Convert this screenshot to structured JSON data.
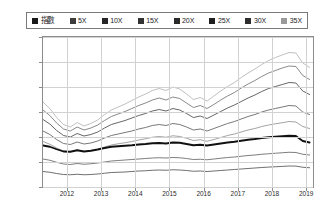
{
  "legend": {
    "position": "top",
    "items": [
      {
        "label": "指數",
        "color": "#1a1a1a",
        "cjk": true
      },
      {
        "label": "5X",
        "color": "#3d3d3d",
        "cjk": false
      },
      {
        "label": "10X",
        "color": "#262626",
        "cjk": false
      },
      {
        "label": "15X",
        "color": "#333333",
        "cjk": false
      },
      {
        "label": "20X",
        "color": "#2b2b2b",
        "cjk": false
      },
      {
        "label": "25X",
        "color": "#1f1f1f",
        "cjk": false
      },
      {
        "label": "30X",
        "color": "#2e2e2e",
        "cjk": false
      },
      {
        "label": "35X",
        "color": "#9a9a9a",
        "cjk": false
      }
    ]
  },
  "axes": {
    "y_ticks": [
      "0",
      "5,000",
      "10,000",
      "15,000",
      "20,000",
      "25,000",
      "30,000"
    ],
    "x_ticks": [
      "2012",
      "2013",
      "2014",
      "2015",
      "2016",
      "2017",
      "2018",
      "2019"
    ]
  },
  "chart_data": {
    "type": "line",
    "title": "",
    "xlabel": "",
    "ylabel": "",
    "ylim": [
      0,
      30000
    ],
    "xlim": [
      2011.3,
      2019.2
    ],
    "grid": true,
    "legend_position": "top",
    "x": [
      2011.3,
      2011.5,
      2011.7,
      2011.9,
      2012.1,
      2012.3,
      2012.5,
      2012.7,
      2012.9,
      2013.1,
      2013.3,
      2013.5,
      2013.7,
      2013.9,
      2014.1,
      2014.3,
      2014.5,
      2014.7,
      2014.9,
      2015.1,
      2015.3,
      2015.5,
      2015.7,
      2015.9,
      2016.1,
      2016.3,
      2016.5,
      2016.7,
      2016.9,
      2017.1,
      2017.3,
      2017.5,
      2017.7,
      2017.9,
      2018.1,
      2018.3,
      2018.5,
      2018.7,
      2018.9,
      2019.1
    ],
    "series": [
      {
        "name": "指數",
        "color": "#111111",
        "width": 1.8,
        "values": [
          8300,
          8050,
          7550,
          7100,
          7050,
          7350,
          7100,
          7250,
          7500,
          7800,
          8050,
          8150,
          8250,
          8350,
          8500,
          8600,
          8750,
          8800,
          8700,
          8900,
          8850,
          8600,
          8350,
          8450,
          8300,
          8500,
          8700,
          8900,
          9050,
          9250,
          9450,
          9600,
          9800,
          9950,
          10050,
          10150,
          10250,
          10200,
          9200,
          8900
        ]
      },
      {
        "name": "5X",
        "color": "#5c5c5c",
        "width": 0.8,
        "values": [
          5600,
          5350,
          4950,
          4600,
          4500,
          4700,
          4550,
          4650,
          4800,
          5000,
          5200,
          5300,
          5400,
          5500,
          5600,
          5700,
          5800,
          5850,
          5800,
          5900,
          5850,
          5700,
          5500,
          5550,
          5450,
          5600,
          5750,
          5900,
          6000,
          6150,
          6300,
          6400,
          6550,
          6650,
          6750,
          6850,
          6950,
          6900,
          6550,
          6400
        ]
      },
      {
        "name": "10X",
        "color": "#4a4a4a",
        "width": 0.8,
        "values": [
          3100,
          2950,
          2700,
          2500,
          2450,
          2550,
          2450,
          2500,
          2600,
          2750,
          2900,
          2950,
          3000,
          3100,
          3200,
          3250,
          3350,
          3400,
          3350,
          3450,
          3400,
          3300,
          3150,
          3200,
          3100,
          3200,
          3300,
          3400,
          3500,
          3600,
          3700,
          3800,
          3900,
          3980,
          4050,
          4120,
          4200,
          4180,
          3950,
          3850
        ]
      },
      {
        "name": "15X",
        "color": "#555555",
        "width": 0.8,
        "values": [
          11200,
          10500,
          9500,
          8700,
          8500,
          9000,
          8600,
          8800,
          9200,
          9800,
          10300,
          10600,
          10900,
          11200,
          11600,
          11900,
          12300,
          12500,
          12300,
          12700,
          12500,
          12000,
          11400,
          11600,
          11200,
          11700,
          12200,
          12700,
          13100,
          13600,
          14100,
          14500,
          15000,
          15400,
          15700,
          16000,
          16300,
          16200,
          15000,
          14500
        ]
      },
      {
        "name": "20X",
        "color": "#3f3f3f",
        "width": 0.8,
        "values": [
          13500,
          12600,
          11300,
          10300,
          10000,
          10700,
          10200,
          10500,
          11000,
          11800,
          12500,
          12900,
          13300,
          13800,
          14300,
          14700,
          15200,
          15500,
          15200,
          15700,
          15400,
          14700,
          13900,
          14200,
          13700,
          14400,
          15100,
          15800,
          16400,
          17100,
          17800,
          18400,
          19100,
          19700,
          20100,
          20500,
          20900,
          20800,
          19200,
          18500
        ]
      },
      {
        "name": "25X",
        "color": "#6b6b6b",
        "width": 0.8,
        "values": [
          15400,
          14300,
          12800,
          11600,
          11200,
          12000,
          11400,
          11800,
          12400,
          13300,
          14100,
          14600,
          15100,
          15700,
          16300,
          16800,
          17400,
          17800,
          17400,
          18000,
          17700,
          16800,
          15900,
          16300,
          15700,
          16500,
          17400,
          18200,
          18900,
          19800,
          20600,
          21300,
          22100,
          22800,
          23300,
          23800,
          24200,
          24100,
          22300,
          21500
        ]
      },
      {
        "name": "30X",
        "color": "#8a8a8a",
        "width": 0.8,
        "values": [
          9100,
          8550,
          7800,
          7200,
          7050,
          7400,
          7100,
          7250,
          7550,
          8000,
          8400,
          8650,
          8850,
          9100,
          9400,
          9650,
          9950,
          10100,
          9950,
          10250,
          10100,
          9750,
          9300,
          9450,
          9150,
          9500,
          9900,
          10300,
          10600,
          11000,
          11400,
          11700,
          12100,
          12400,
          12650,
          12850,
          13100,
          13000,
          12100,
          11700
        ]
      },
      {
        "name": "35X",
        "color": "#b8b8b8",
        "width": 0.9,
        "values": [
          17000,
          15700,
          13900,
          12500,
          12000,
          12900,
          12200,
          12700,
          13400,
          14500,
          15400,
          16000,
          16600,
          17300,
          18000,
          18600,
          19300,
          19700,
          19300,
          20000,
          19600,
          18600,
          17500,
          17900,
          17200,
          18200,
          19200,
          20100,
          20900,
          21900,
          22800,
          23600,
          24500,
          25300,
          25900,
          26400,
          26900,
          26800,
          24800,
          23900
        ]
      }
    ]
  }
}
